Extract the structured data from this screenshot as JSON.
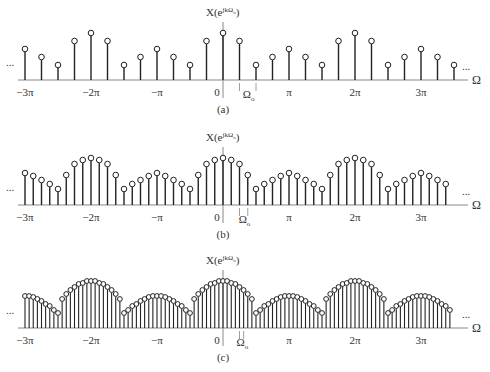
{
  "figure": {
    "axis_label": "Ω",
    "ylabel": "X(e^{jkΩ₀})",
    "ylabel_text": "X(e",
    "ylabel_sup": "jkΩ",
    "ylabel_sub": "o",
    "ylabel_close": ")",
    "omega0_label": "Ω",
    "omega0_sub": "o",
    "ellipsis": "...",
    "tick_labels": [
      "−3π",
      "−2π",
      "−π",
      "0",
      "π",
      "2π",
      "3π"
    ],
    "colors": {
      "stem": "#222222",
      "axis": "#888888",
      "text": "#333333"
    }
  },
  "chart_data": [
    {
      "type": "stem",
      "panel": "(a)",
      "title": "(a)",
      "xlabel": "Ω",
      "ylabel": "X(e^{jkΩ₀})",
      "omega0": "π/4",
      "samples_per_period": 8,
      "period": "2π",
      "x_ticks": [
        "−3π",
        "−2π",
        "−π",
        "0",
        "π",
        "2π",
        "3π"
      ],
      "period_values": [
        47,
        39,
        15,
        23,
        31,
        23,
        15,
        39
      ],
      "x_range_in_pi": [
        -3,
        3.5
      ]
    },
    {
      "type": "stem",
      "panel": "(b)",
      "title": "(b)",
      "xlabel": "Ω",
      "ylabel": "X(e^{jkΩ₀})",
      "omega0": "π/8",
      "samples_per_period": 16,
      "period": "2π",
      "x_ticks": [
        "−3π",
        "−2π",
        "−π",
        "0",
        "π",
        "2π",
        "3π"
      ],
      "period_values": [
        47,
        45,
        41,
        30,
        16,
        21,
        25,
        29,
        32,
        29,
        25,
        21,
        16,
        30,
        41,
        45
      ],
      "x_range_in_pi": [
        -3,
        3.5
      ]
    },
    {
      "type": "stem",
      "panel": "(c)",
      "title": "(c)",
      "xlabel": "Ω",
      "ylabel": "X(e^{jkΩ₀})",
      "omega0": "π/16",
      "samples_per_period": 32,
      "period": "2π",
      "x_ticks": [
        "−3π",
        "−2π",
        "−π",
        "0",
        "π",
        "2π",
        "3π"
      ],
      "period_values": [
        47,
        47,
        45,
        44,
        41,
        38,
        34,
        29,
        15,
        18,
        22,
        24,
        27,
        29,
        31,
        32,
        32,
        32,
        31,
        29,
        27,
        24,
        22,
        18,
        15,
        29,
        34,
        38,
        41,
        44,
        45,
        47
      ],
      "x_range_in_pi": [
        -3,
        3.5
      ]
    }
  ]
}
